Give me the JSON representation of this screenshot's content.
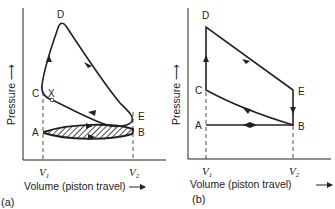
{
  "diagram_a": {
    "panel_label": "(a)",
    "y_axis_label": "Pressure ⟶",
    "x_axis_label": "Volume (piston travel)",
    "x_axis_arrow": "⟶",
    "v1_label": "V",
    "v1_sub": "1",
    "v2_label": "V",
    "v2_sub": "2",
    "points": {
      "A": "A",
      "B": "B",
      "C": "C",
      "D": "D",
      "E": "E",
      "X": "X"
    }
  },
  "diagram_b": {
    "panel_label": "(b)",
    "y_axis_label": "Pressure ⟶",
    "x_axis_label": "Volume (piston travel)",
    "x_axis_arrow": "⟶",
    "v1_label": "V",
    "v1_sub": "1",
    "v2_label": "V",
    "v2_sub": "2",
    "points": {
      "A": "A",
      "B": "B",
      "C": "C",
      "D": "D",
      "E": "E"
    }
  }
}
